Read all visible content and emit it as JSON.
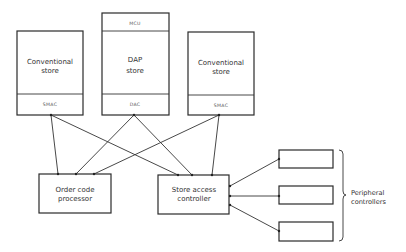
{
  "diagram": {
    "stores": [
      {
        "id": "store-left",
        "title_line1": "Conventional",
        "title_line2": "store",
        "controller": "SMAC"
      },
      {
        "id": "store-dap",
        "header": "MCU",
        "title_line1": "DAP",
        "title_line2": "store",
        "controller": "DAC"
      },
      {
        "id": "store-right",
        "title_line1": "Conventional",
        "title_line2": "store",
        "controller": "SMAC"
      }
    ],
    "processors": [
      {
        "id": "order-code-processor",
        "line1": "Order code",
        "line2": "processor"
      },
      {
        "id": "store-access-controller",
        "line1": "Store access",
        "line2": "controller"
      }
    ],
    "peripherals": {
      "count": 3,
      "label_line1": "Peripheral",
      "label_line2": "controllers"
    },
    "connections": [
      {
        "from": "SMAC (left)",
        "to": "Order code processor"
      },
      {
        "from": "SMAC (left)",
        "to": "Store access controller"
      },
      {
        "from": "DAC",
        "to": "Order code processor"
      },
      {
        "from": "DAC",
        "to": "Store access controller"
      },
      {
        "from": "SMAC (right)",
        "to": "Order code processor"
      },
      {
        "from": "SMAC (right)",
        "to": "Store access controller"
      },
      {
        "from": "Store access controller",
        "to": "Peripheral controller 1"
      },
      {
        "from": "Store access controller",
        "to": "Peripheral controller 2"
      },
      {
        "from": "Store access controller",
        "to": "Peripheral controller 3"
      }
    ]
  }
}
